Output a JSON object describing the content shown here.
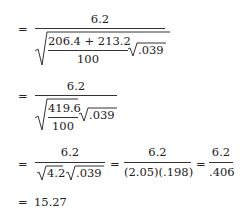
{
  "equation": {
    "step1": {
      "eq": "=",
      "numerator": "6.2",
      "inner_numerator": "206.4 + 213.2",
      "inner_denominator": "100",
      "radicand2": ".039"
    },
    "step2": {
      "eq": "=",
      "numerator": "6.2",
      "inner_numerator": "419.6",
      "inner_denominator": "100",
      "radicand2": ".039"
    },
    "step3": {
      "eq1": "=",
      "frac1_numerator": "6.2",
      "frac1_radicand1": "4.2",
      "frac1_radicand2": ".039",
      "eq2": "=",
      "frac2_numerator": "6.2",
      "frac2_denominator": "(2.05)(.198)",
      "eq3": "=",
      "frac3_numerator": "6.2",
      "frac3_denominator": ".406"
    },
    "step4": {
      "eq": "=",
      "result": "15.27"
    }
  }
}
